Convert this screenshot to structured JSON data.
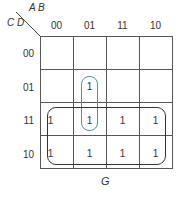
{
  "kmap": {
    "column_vars": "A B",
    "row_vars": "C D",
    "column_headers": [
      "00",
      "01",
      "11",
      "10"
    ],
    "row_headers": [
      "00",
      "01",
      "11",
      "10"
    ],
    "cells": [
      [
        "",
        "",
        "",
        ""
      ],
      [
        "",
        "1",
        "",
        ""
      ],
      [
        "1",
        "1",
        "1",
        "1"
      ],
      [
        "1",
        "1",
        "1",
        "1"
      ]
    ],
    "groupings": [
      {
        "name": "vertical pair",
        "cells": "AB=01, CD=01..11",
        "color": "#5b8f95"
      },
      {
        "name": "bottom two rows",
        "cells": "CD=11..10, all AB",
        "color": "#333333"
      }
    ],
    "output_label": "G"
  }
}
